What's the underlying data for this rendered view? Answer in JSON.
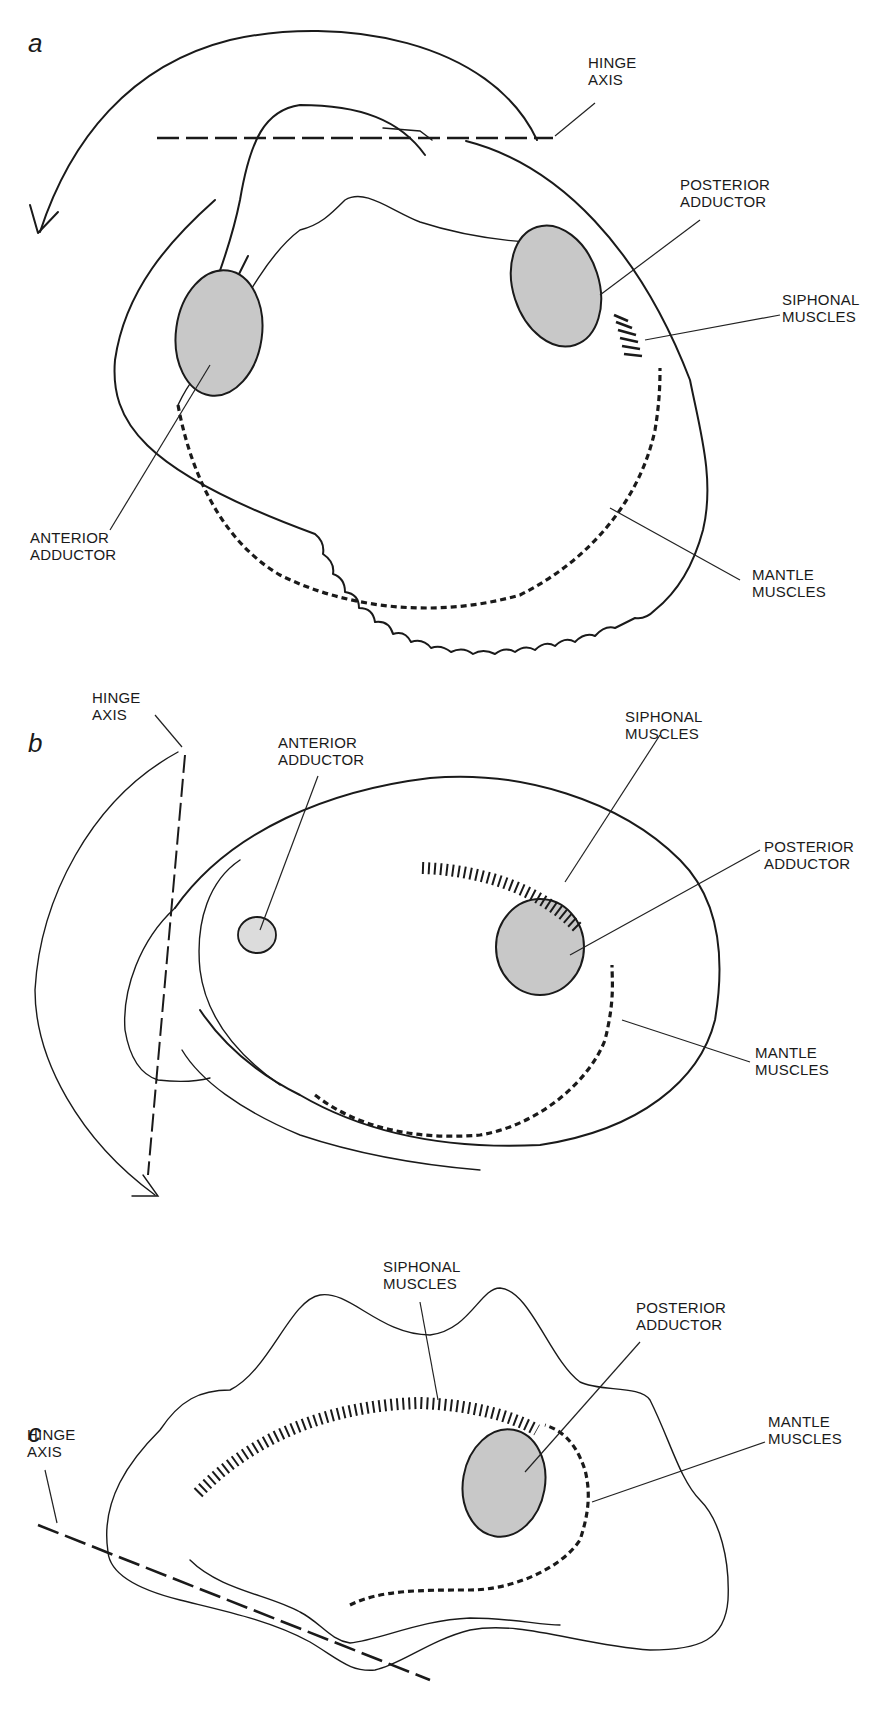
{
  "figure": {
    "panels": [
      {
        "id": "a",
        "letter": "a",
        "labels": {
          "hinge_axis": [
            "HINGE",
            "AXIS"
          ],
          "posterior_adductor": [
            "POSTERIOR",
            "ADDUCTOR"
          ],
          "siphonal_muscles": [
            "SIPHONAL",
            "MUSCLES"
          ],
          "anterior_adductor": [
            "ANTERIOR",
            "ADDUCTOR"
          ],
          "mantle_muscles": [
            "MANTLE",
            "MUSCLES"
          ]
        }
      },
      {
        "id": "b",
        "letter": "b",
        "labels": {
          "hinge_axis": [
            "HINGE",
            "AXIS"
          ],
          "anterior_adductor": [
            "ANTERIOR",
            "ADDUCTOR"
          ],
          "siphonal_muscles": [
            "SIPHONAL",
            "MUSCLES"
          ],
          "posterior_adductor": [
            "POSTERIOR",
            "ADDUCTOR"
          ],
          "mantle_muscles": [
            "MANTLE",
            "MUSCLES"
          ]
        }
      },
      {
        "id": "c",
        "letter": "c",
        "labels": {
          "siphonal_muscles": [
            "SIPHONAL",
            "MUSCLES"
          ],
          "posterior_adductor": [
            "POSTERIOR",
            "ADDUCTOR"
          ],
          "hinge_axis": [
            "HINGE",
            "AXIS"
          ],
          "mantle_muscles": [
            "MANTLE",
            "MUSCLES"
          ]
        }
      }
    ],
    "colors": {
      "line": "#1a1a1a",
      "adductor_fill": "#c8c8c8",
      "adductor_light_fill": "#dcdcdc",
      "background": "#ffffff"
    }
  }
}
